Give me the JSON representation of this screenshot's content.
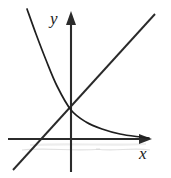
{
  "figure": {
    "kind": "cartesian-graph",
    "background_color": "#ffffff",
    "axis_color": "#2b2b2b",
    "curve_color": "#1f1f1f",
    "line_color": "#2a2a2a",
    "smudge_color": "#c9c9c9"
  },
  "axes": {
    "x_label": "x",
    "y_label": "y",
    "origin": {
      "x": 71,
      "y": 139
    },
    "x_axis": {
      "start_x": 8,
      "end_x": 152,
      "y": 139,
      "arrow": "right"
    },
    "y_axis": {
      "x": 71,
      "start_y": 172,
      "end_y": 12,
      "arrow": "up"
    },
    "ticks_shown": false,
    "tick_labels": [],
    "grid": false
  },
  "chart_data": {
    "type": "line",
    "title": "",
    "subtitle": "",
    "xlabel": "x",
    "ylabel": "y",
    "xlim": [
      -2.2,
      3.0
    ],
    "ylim": [
      -1.1,
      4.6
    ],
    "grid": false,
    "legend": "none",
    "annotations": [],
    "series": [
      {
        "name": "exponential-decay",
        "expression": "y = e^(-x)",
        "stroke": "#1f1f1f",
        "x": [
          -1.55,
          -1.3,
          -1.05,
          -0.8,
          -0.55,
          -0.3,
          -0.05,
          0.0,
          0.25,
          0.5,
          0.8,
          1.1,
          1.45,
          1.85,
          2.3,
          2.75
        ],
        "y": [
          4.71,
          3.67,
          2.86,
          2.23,
          1.73,
          1.35,
          1.05,
          1.0,
          0.78,
          0.61,
          0.45,
          0.33,
          0.23,
          0.16,
          0.1,
          0.06
        ],
        "pixel_path": [
          {
            "x": 27,
            "y": 9
          },
          {
            "x": 36,
            "y": 34
          },
          {
            "x": 46,
            "y": 60
          },
          {
            "x": 57,
            "y": 86
          },
          {
            "x": 71,
            "y": 110
          },
          {
            "x": 86,
            "y": 122
          },
          {
            "x": 102,
            "y": 129
          },
          {
            "x": 120,
            "y": 134
          },
          {
            "x": 140,
            "y": 137
          },
          {
            "x": 149,
            "y": 138
          }
        ]
      },
      {
        "name": "linear-identity",
        "expression": "y = x",
        "stroke": "#2a2a2a",
        "x": [
          -2.05,
          0.0,
          3.0
        ],
        "y": [
          -1.03,
          1.0,
          4.05
        ],
        "pixel_path": [
          {
            "x": 13,
            "y": 170
          },
          {
            "x": 41,
            "y": 139
          },
          {
            "x": 71,
            "y": 110
          },
          {
            "x": 155,
            "y": 14
          }
        ]
      }
    ],
    "intersection_points": [
      {
        "label": "",
        "pixel": {
          "x": 71,
          "y": 110
        },
        "note": "both curves meet on the y-axis"
      }
    ]
  },
  "artifacts": {
    "scan_smudges": [
      {
        "name": "smudge-under-axis-left",
        "d": "M 22 150 C 48 147, 74 152, 100 149"
      },
      {
        "name": "smudge-under-axis-right",
        "d": "M 96 149 C 114 152, 132 147, 150 150"
      },
      {
        "name": "smudge-soft-band",
        "d": "M 30 145 C 70 143, 110 146, 146 144"
      }
    ]
  }
}
